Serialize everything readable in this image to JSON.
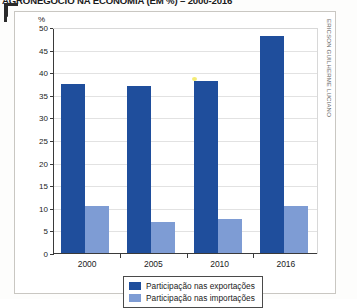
{
  "figure": {
    "title": "AGRONEGÓCIO NA ECONOMIA (EM %) – 2000-2016",
    "unit_label": "%",
    "credit": "ERICSON GUILHERME LUCIANO"
  },
  "legend": {
    "items": [
      {
        "label": "Participação nas exportações",
        "color": "#1f4e9c"
      },
      {
        "label": "Participação nas importações",
        "color": "#7e9cd4"
      }
    ]
  },
  "axis": {
    "y_ticks": [
      "50",
      "45",
      "40",
      "35",
      "30",
      "25",
      "20",
      "15",
      "10",
      "5",
      "0"
    ],
    "x_ticks": [
      "2000",
      "2005",
      "2010",
      "2016"
    ]
  },
  "chart_data": {
    "type": "bar",
    "title": "AGRONEGÓCIO NA ECONOMIA (EM %) – 2000-2016",
    "xlabel": "",
    "ylabel": "%",
    "ylim": [
      0,
      50
    ],
    "ytick_step": 5,
    "grid": true,
    "legend_position": "bottom-center",
    "categories": [
      "2000",
      "2005",
      "2010",
      "2016"
    ],
    "series": [
      {
        "name": "Participação nas exportações",
        "color": "#1f4e9c",
        "values": [
          37.5,
          37.0,
          38.0,
          48.0
        ]
      },
      {
        "name": "Participação nas importações",
        "color": "#7e9cd4",
        "values": [
          10.5,
          6.8,
          7.5,
          10.4
        ]
      }
    ]
  }
}
